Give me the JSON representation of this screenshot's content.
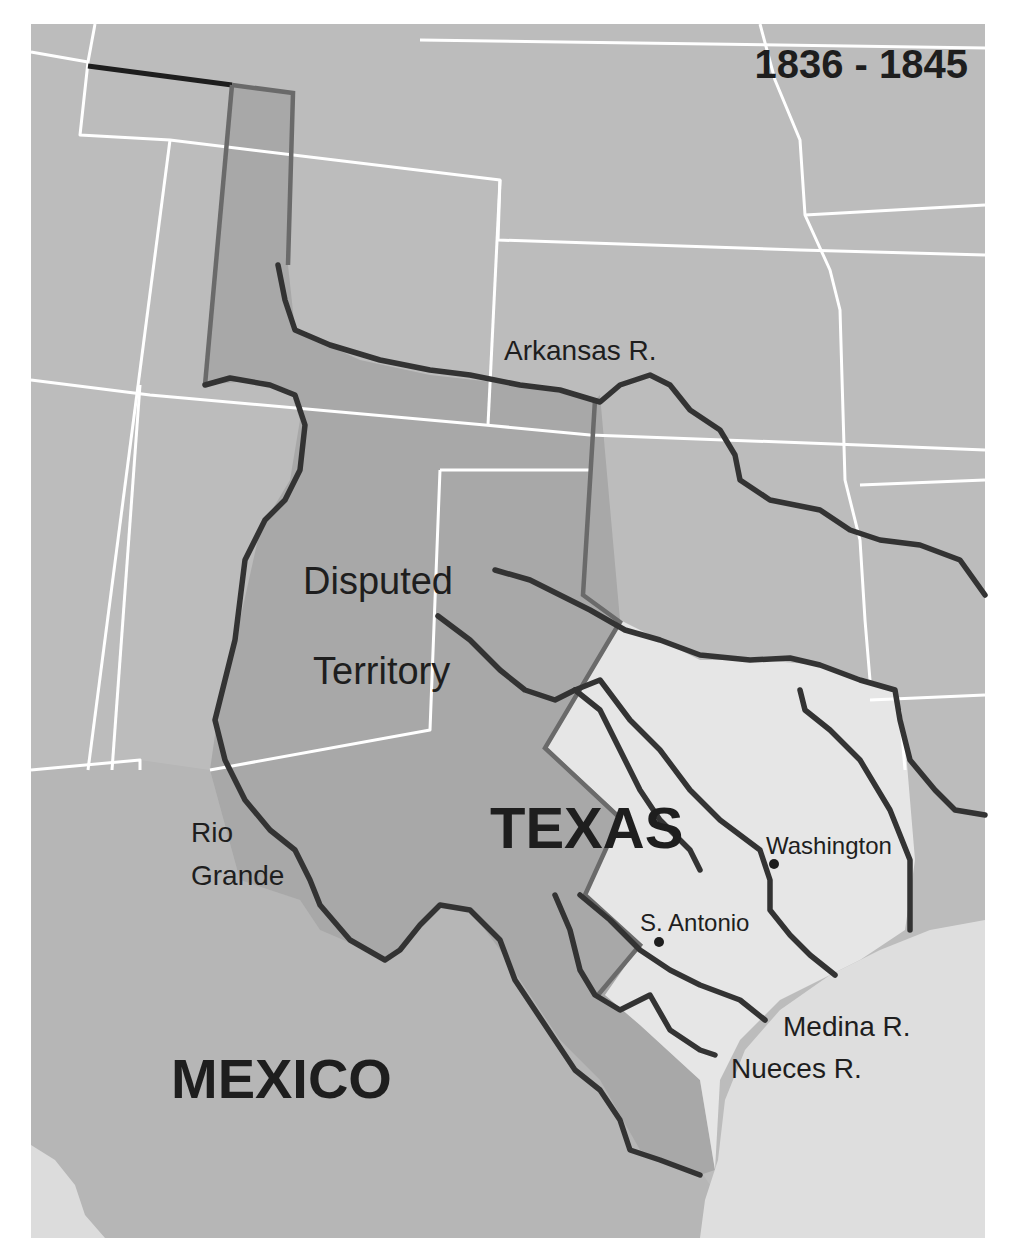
{
  "map": {
    "title": "1836 - 1845",
    "colors": {
      "outside_states": "#bcbcbc",
      "disputed_territory": "#a6a6a6",
      "texas_core": "#e6e6e6",
      "gulf": "#dedede",
      "state_lines": "#ffffff",
      "rivers": "#333333",
      "claim_border": "#6a6a6a",
      "text": "#1e1e1e"
    },
    "region_labels": {
      "texas": "TEXAS",
      "mexico": "MEXICO",
      "disputed_line1": "Disputed",
      "disputed_line2": "Territory"
    },
    "river_labels": {
      "arkansas": "Arkansas R.",
      "rio_grande_line1": "Rio",
      "rio_grande_line2": "Grande",
      "medina": "Medina R.",
      "nueces": "Nueces R."
    },
    "cities": [
      {
        "name": "Washington"
      },
      {
        "name": "S. Antonio"
      }
    ]
  }
}
